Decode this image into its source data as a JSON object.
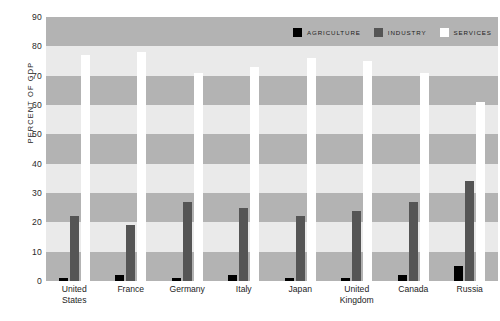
{
  "chart_data": {
    "type": "bar",
    "title": "",
    "xlabel": "",
    "ylabel": "PERCENT OF GDP",
    "ylim": [
      0,
      90
    ],
    "yticks": [
      0,
      10,
      20,
      30,
      40,
      50,
      60,
      70,
      80,
      90
    ],
    "ytick_labels": [
      "0",
      "10",
      "20",
      "30",
      "40",
      "50",
      "60",
      "70",
      "80",
      "90"
    ],
    "grid": "horizontal-alternating-bands",
    "legend_position": "top-right",
    "categories": [
      "United States",
      "France",
      "Germany",
      "Italy",
      "Japan",
      "United Kingdom",
      "Canada",
      "Russia"
    ],
    "category_lines": [
      [
        "United",
        "States"
      ],
      [
        "France"
      ],
      [
        "Germany"
      ],
      [
        "Italy"
      ],
      [
        "Japan"
      ],
      [
        "United",
        "Kingdom"
      ],
      [
        "Canada"
      ],
      [
        "Russia"
      ]
    ],
    "series": [
      {
        "name": "AGRICULTURE",
        "color": "#000000",
        "values": [
          1,
          2,
          1,
          2,
          1,
          1,
          2,
          5
        ]
      },
      {
        "name": "INDUSTRY",
        "color": "#555555",
        "values": [
          22,
          19,
          27,
          25,
          22,
          24,
          27,
          34
        ]
      },
      {
        "name": "SERVICES",
        "color": "#ffffff",
        "values": [
          77,
          78,
          71,
          73,
          76,
          75,
          71,
          61
        ]
      }
    ]
  },
  "legend": {
    "items": [
      {
        "label": "AGRICULTURE",
        "color": "#000000"
      },
      {
        "label": "INDUSTRY",
        "color": "#555555"
      },
      {
        "label": "SERVICES",
        "color": "#ffffff"
      }
    ]
  },
  "colors": {
    "band_dark": "#b3b3b3",
    "band_light": "#eaeaea",
    "agriculture": "#000000",
    "industry": "#555555",
    "services": "#ffffff",
    "text": "#1d1d1d"
  }
}
